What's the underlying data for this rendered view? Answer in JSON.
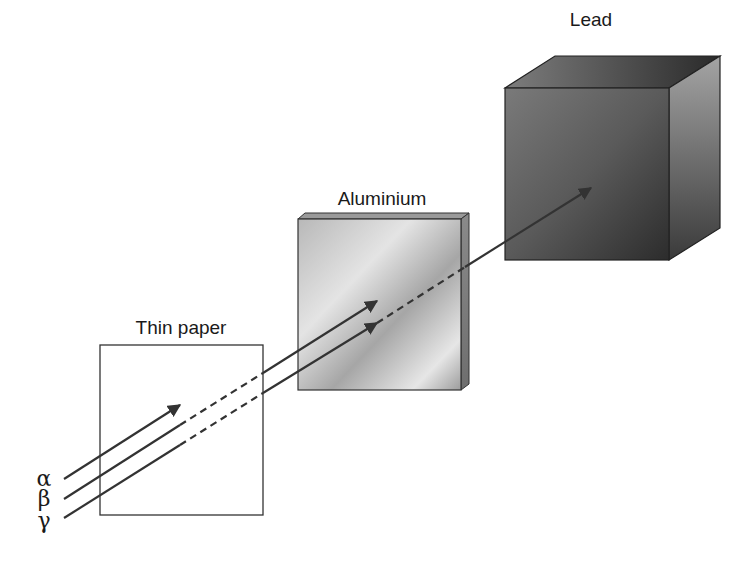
{
  "diagram": {
    "materials": [
      {
        "id": "paper",
        "label": "Thin paper"
      },
      {
        "id": "aluminium",
        "label": "Aluminium"
      },
      {
        "id": "lead",
        "label": "Lead"
      }
    ],
    "rays": [
      {
        "id": "alpha",
        "symbol": "α",
        "stopped_by": "Thin paper"
      },
      {
        "id": "beta",
        "symbol": "β",
        "stopped_by": "Aluminium"
      },
      {
        "id": "gamma",
        "symbol": "γ",
        "stopped_by": "Lead"
      }
    ],
    "colors": {
      "line": "#333333",
      "paper_fill": "#ffffff",
      "aluminium_light": "#e2e2e2",
      "aluminium_dark": "#9a9a9a",
      "lead_light": "#8c8c8c",
      "lead_dark": "#2e2e2e"
    }
  }
}
